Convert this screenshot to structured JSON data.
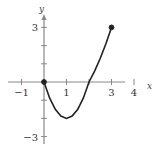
{
  "chart_data": {
    "type": "line",
    "title": "",
    "xlabel": "x",
    "ylabel": "y",
    "xlim": [
      -1.4,
      4.5
    ],
    "ylim": [
      -3.3,
      3.5
    ],
    "grid": false,
    "x_ticks": [
      -1,
      1,
      2,
      3,
      4
    ],
    "x_tick_labels": [
      "−1",
      "1",
      "",
      "3",
      "4"
    ],
    "y_ticks": [
      3,
      2,
      1,
      -1,
      -2,
      -3
    ],
    "y_tick_labels": [
      "3",
      "",
      "",
      "",
      "",
      "−3"
    ],
    "series": [
      {
        "name": "f(x)",
        "x": [
          0,
          0.25,
          0.5,
          0.75,
          1,
          1.25,
          1.5,
          1.75,
          2,
          2.25,
          2.5,
          2.75,
          3
        ],
        "y": [
          0,
          -0.875,
          -1.5,
          -1.875,
          -2,
          -1.875,
          -1.5,
          -0.875,
          0,
          0.6,
          1.3,
          2.1,
          3
        ],
        "endpoints": [
          {
            "x": 0,
            "y": 0,
            "style": "filled"
          },
          {
            "x": 3,
            "y": 3,
            "style": "filled"
          }
        ]
      }
    ],
    "colors": {
      "axis": "#888888",
      "curve": "#222222"
    }
  }
}
